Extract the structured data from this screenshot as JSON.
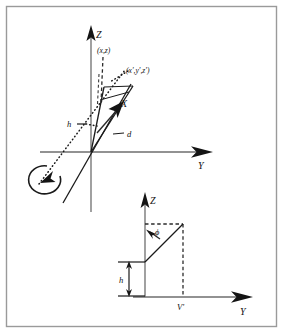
{
  "figure": {
    "caption_present": false,
    "border_color": "#9a9a9a",
    "background": "#ffffff",
    "axis_color": "#6e6e6e",
    "ink_color": "#141414"
  },
  "top_diagram": {
    "name": "3d-axes-rotation-diagram",
    "axes": [
      {
        "id": "z",
        "label": "Z"
      },
      {
        "id": "y",
        "label": "Y"
      },
      {
        "id": "x",
        "label": "X"
      }
    ],
    "labels": {
      "point_xz": "(x,z)",
      "point_xyz_prime": "(x',y',z')",
      "height": "h",
      "distance": "d"
    }
  },
  "bottom_diagram": {
    "name": "yz-plane-projection-diagram",
    "axes": [
      {
        "id": "z2",
        "label": "Z"
      },
      {
        "id": "y2",
        "label": "Y"
      }
    ],
    "labels": {
      "angle_phi": "ϕ",
      "height": "h",
      "v_prime": "V'"
    }
  }
}
